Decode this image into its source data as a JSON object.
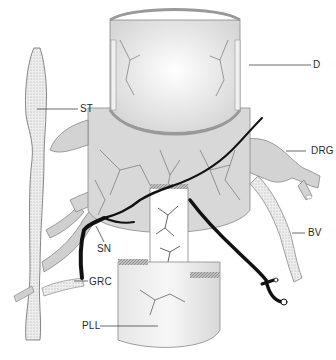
{
  "figure": {
    "labels": {
      "D": "D",
      "ST": "ST",
      "DRG": "DRG",
      "SN": "SN",
      "BV": "BV",
      "GRC": "GRC",
      "PLL": "PLL"
    },
    "colors": {
      "nerve": "#111111",
      "tissue_fill": "#d9d9d9",
      "tissue_stroke": "#7a7a7a",
      "dura_fill": "#efefef",
      "background": "#ffffff"
    }
  }
}
